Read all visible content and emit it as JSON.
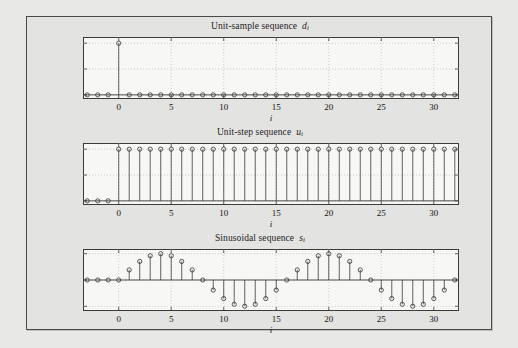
{
  "figure": {
    "background_color": "#e3e3e1",
    "page_color": "#e8e8e6",
    "axes_face_color": "#f7f7f5",
    "line_color": "#3b3b3b",
    "grid_color": "#b9b9b9"
  },
  "panels": [
    {
      "id": "unit-sample",
      "title_text": "Unit-sample sequence",
      "title_symbol": "d",
      "title_subscript": "i",
      "xlabel": "i",
      "yticks": [
        "1",
        "0.5",
        "0"
      ],
      "xticks": [
        "0",
        "5",
        "10",
        "15",
        "20",
        "25",
        "30"
      ]
    },
    {
      "id": "unit-step",
      "title_text": "Unit-step sequence",
      "title_symbol": "u",
      "title_subscript": "i",
      "xlabel": "i",
      "yticks": [
        "1",
        "0.5",
        "0"
      ],
      "xticks": [
        "0",
        "5",
        "10",
        "15",
        "20",
        "25",
        "30"
      ]
    },
    {
      "id": "sinusoidal",
      "title_text": "Sinusoidal sequence",
      "title_symbol": "s",
      "title_subscript": "i",
      "xlabel": "i",
      "yticks": [
        "1",
        "0",
        "-1"
      ],
      "xticks": [
        "0",
        "5",
        "10",
        "15",
        "20",
        "25",
        "30"
      ]
    }
  ],
  "chart_data": [
    {
      "type": "line",
      "plot_style": "stem",
      "title": "Unit-sample sequence d_i",
      "xlabel": "i",
      "ylabel": "",
      "xlim": [
        -3.4,
        32.4
      ],
      "ylim": [
        -0.08,
        1.12
      ],
      "xticks": [
        0,
        5,
        10,
        15,
        20,
        25,
        30
      ],
      "yticks": [
        0,
        0.5,
        1
      ],
      "grid": true,
      "legend": null,
      "x": [
        -3,
        -2,
        -1,
        0,
        1,
        2,
        3,
        4,
        5,
        6,
        7,
        8,
        9,
        10,
        11,
        12,
        13,
        14,
        15,
        16,
        17,
        18,
        19,
        20,
        21,
        22,
        23,
        24,
        25,
        26,
        27,
        28,
        29,
        30,
        31,
        32
      ],
      "values": [
        0,
        0,
        0,
        1,
        0,
        0,
        0,
        0,
        0,
        0,
        0,
        0,
        0,
        0,
        0,
        0,
        0,
        0,
        0,
        0,
        0,
        0,
        0,
        0,
        0,
        0,
        0,
        0,
        0,
        0,
        0,
        0,
        0,
        0,
        0,
        0
      ]
    },
    {
      "type": "line",
      "plot_style": "stem",
      "title": "Unit-step sequence u_i",
      "xlabel": "i",
      "ylabel": "",
      "xlim": [
        -3.4,
        32.4
      ],
      "ylim": [
        -0.08,
        1.12
      ],
      "xticks": [
        0,
        5,
        10,
        15,
        20,
        25,
        30
      ],
      "yticks": [
        0,
        0.5,
        1
      ],
      "grid": true,
      "legend": null,
      "x": [
        -3,
        -2,
        -1,
        0,
        1,
        2,
        3,
        4,
        5,
        6,
        7,
        8,
        9,
        10,
        11,
        12,
        13,
        14,
        15,
        16,
        17,
        18,
        19,
        20,
        21,
        22,
        23,
        24,
        25,
        26,
        27,
        28,
        29,
        30,
        31,
        32
      ],
      "values": [
        0,
        0,
        0,
        1,
        1,
        1,
        1,
        1,
        1,
        1,
        1,
        1,
        1,
        1,
        1,
        1,
        1,
        1,
        1,
        1,
        1,
        1,
        1,
        1,
        1,
        1,
        1,
        1,
        1,
        1,
        1,
        1,
        1,
        1,
        1,
        1
      ]
    },
    {
      "type": "line",
      "plot_style": "stem",
      "title": "Sinusoidal sequence s_i",
      "xlabel": "i",
      "ylabel": "",
      "xlim": [
        -3.4,
        32.4
      ],
      "ylim": [
        -1.18,
        1.18
      ],
      "xticks": [
        0,
        5,
        10,
        15,
        20,
        25,
        30
      ],
      "yticks": [
        -1,
        0,
        1
      ],
      "grid": true,
      "legend": null,
      "formula": "sin(2*pi*i/16) for i >= 0, 0 for i < 0",
      "x": [
        -3,
        -2,
        -1,
        0,
        1,
        2,
        3,
        4,
        5,
        6,
        7,
        8,
        9,
        10,
        11,
        12,
        13,
        14,
        15,
        16,
        17,
        18,
        19,
        20,
        21,
        22,
        23,
        24,
        25,
        26,
        27,
        28,
        29,
        30,
        31,
        32
      ],
      "values": [
        0,
        0,
        0,
        0,
        0.383,
        0.707,
        0.924,
        1.0,
        0.924,
        0.707,
        0.383,
        0.0,
        -0.383,
        -0.707,
        -0.924,
        -1.0,
        -0.924,
        -0.707,
        -0.383,
        0.0,
        0.383,
        0.707,
        0.924,
        1.0,
        0.924,
        0.707,
        0.383,
        0.0,
        -0.383,
        -0.707,
        -0.924,
        -1.0,
        -0.924,
        -0.707,
        -0.383,
        0.0
      ]
    }
  ]
}
